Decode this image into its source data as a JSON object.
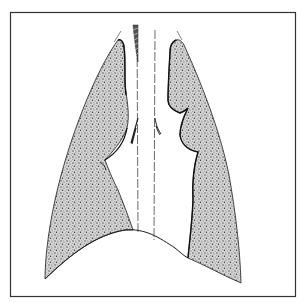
{
  "figure": {
    "colors": {
      "background": "#ffffff",
      "frame": "#333333",
      "outline": "#1a1a1a",
      "stipple_dark": "#3a3a3a",
      "stipple_light": "#9a9a9a"
    },
    "parts": [
      {
        "id": "left-lung",
        "label": ""
      },
      {
        "id": "right-lung",
        "label": ""
      },
      {
        "id": "trachea",
        "label": ""
      },
      {
        "id": "diaphragm",
        "label": ""
      }
    ]
  }
}
